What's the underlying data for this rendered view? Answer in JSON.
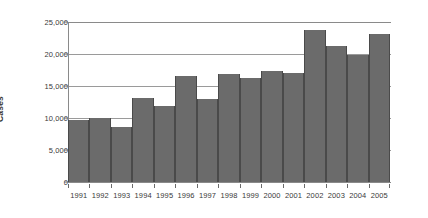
{
  "chart_data": {
    "type": "bar",
    "title": "",
    "xlabel": "",
    "ylabel": "Cases",
    "ylim": [
      0,
      25000
    ],
    "ytick_values": [
      25000,
      20000,
      15000,
      10000,
      5000,
      0
    ],
    "ytick_labels": [
      "25,000",
      "20,000",
      "15,000",
      "10,000",
      "5,000",
      "0"
    ],
    "grid": "horizontal",
    "legend": "none",
    "categories": [
      "1991",
      "1992",
      "1993",
      "1994",
      "1995",
      "1996",
      "1997",
      "1998",
      "1999",
      "2000",
      "2001",
      "2002",
      "2003",
      "2004",
      "2005"
    ],
    "values": [
      9700,
      10000,
      8600,
      13100,
      11900,
      16500,
      13000,
      16800,
      16300,
      17400,
      17100,
      23700,
      21200,
      19900,
      23200
    ],
    "bar_color": "#6b6b6b",
    "bar_edge_color": "#4a4a4a",
    "background_color": "#ffffff",
    "axis_color": "#8a8a8a",
    "grid_color": "#9a9a9a",
    "text_color": "#3a3a3a"
  }
}
